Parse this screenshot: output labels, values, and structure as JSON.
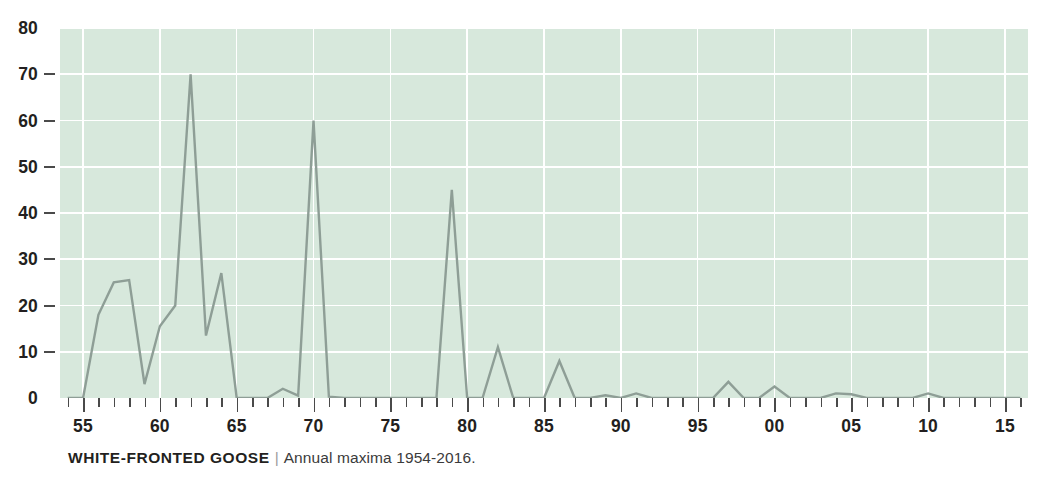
{
  "caption": {
    "species": "WHITE-FRONTED GOOSE",
    "separator": "|",
    "subtitle": "Annual maxima 1954-2016."
  },
  "chart_data": {
    "type": "line",
    "title": "WHITE-FRONTED GOOSE",
    "subtitle": "Annual maxima 1954-2016.",
    "xlabel": "",
    "ylabel": "",
    "ylim": [
      0,
      80
    ],
    "xlim": [
      1953.5,
      2016.5
    ],
    "grid": true,
    "legend": false,
    "y_ticks": [
      0,
      10,
      20,
      30,
      40,
      50,
      60,
      70,
      80
    ],
    "x_tick_labels": [
      "55",
      "60",
      "65",
      "70",
      "75",
      "80",
      "85",
      "90",
      "95",
      "00",
      "05",
      "10",
      "15"
    ],
    "x_tick_years": [
      1955,
      1960,
      1965,
      1970,
      1975,
      1980,
      1985,
      1990,
      1995,
      2000,
      2005,
      2010,
      2015
    ],
    "colors": {
      "plot_background": "#d7e8dc",
      "gridline": "#ffffff",
      "line": "#8e9e96",
      "text": "#231f20"
    },
    "x": [
      1954,
      1955,
      1956,
      1957,
      1958,
      1959,
      1960,
      1961,
      1962,
      1963,
      1964,
      1965,
      1966,
      1967,
      1968,
      1969,
      1970,
      1971,
      1972,
      1973,
      1974,
      1975,
      1976,
      1977,
      1978,
      1979,
      1980,
      1981,
      1982,
      1983,
      1984,
      1985,
      1986,
      1987,
      1988,
      1989,
      1990,
      1991,
      1992,
      1993,
      1994,
      1995,
      1996,
      1997,
      1998,
      1999,
      2000,
      2001,
      2002,
      2003,
      2004,
      2005,
      2006,
      2007,
      2008,
      2009,
      2010,
      2011,
      2012,
      2013,
      2014,
      2015,
      2016
    ],
    "values": [
      0,
      0,
      18,
      25,
      25.5,
      3,
      15.5,
      20,
      70,
      13.5,
      27,
      0,
      0,
      0,
      2,
      0.5,
      60,
      0.3,
      0,
      0,
      0,
      0,
      0,
      0,
      0,
      45,
      0,
      0,
      11,
      0,
      0,
      0,
      8,
      0,
      0,
      0.6,
      0,
      1,
      0,
      0,
      0,
      0,
      0,
      3.5,
      0,
      0,
      2.5,
      0,
      0,
      0,
      1,
      0.8,
      0,
      0,
      0,
      0,
      1,
      0,
      0,
      0,
      0,
      0,
      0
    ],
    "notable_peaks": [
      {
        "year": 1962,
        "value": 70
      },
      {
        "year": 1970,
        "value": 60
      },
      {
        "year": 1979,
        "value": 45
      },
      {
        "year": 1964,
        "value": 27
      },
      {
        "year": 1958,
        "value": 25.5
      },
      {
        "year": 1957,
        "value": 25
      },
      {
        "year": 1961,
        "value": 20
      },
      {
        "year": 1956,
        "value": 18
      },
      {
        "year": 1960,
        "value": 15.5
      },
      {
        "year": 1963,
        "value": 13.5
      },
      {
        "year": 1982,
        "value": 11
      },
      {
        "year": 1986,
        "value": 8
      }
    ]
  }
}
